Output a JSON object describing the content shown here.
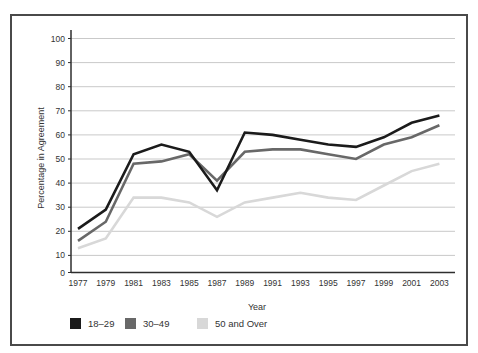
{
  "chart_data": {
    "type": "line",
    "title": "",
    "xlabel": "Year",
    "ylabel": "Percentage in Agreement",
    "categories": [
      "1977",
      "1979",
      "1981",
      "1983",
      "1985",
      "1987",
      "1989",
      "1991",
      "1993",
      "1995",
      "1997",
      "1999",
      "2001",
      "2003"
    ],
    "y_ticks": [
      100,
      90,
      80,
      70,
      60,
      50,
      40,
      30,
      20,
      10,
      0
    ],
    "ylim": [
      0,
      100
    ],
    "grid": true,
    "legend_position": "bottom-left",
    "series": [
      {
        "name": "18–29",
        "color": "#1b1b1b",
        "values": [
          21,
          29,
          52,
          56,
          53,
          37,
          61,
          60,
          58,
          56,
          55,
          59,
          65,
          68
        ]
      },
      {
        "name": "30–49",
        "color": "#686868",
        "values": [
          16,
          24,
          48,
          49,
          52,
          41,
          53,
          54,
          54,
          52,
          50,
          56,
          59,
          64
        ]
      },
      {
        "name": "50 and Over",
        "color": "#d8d8d8",
        "values": [
          13,
          17,
          34,
          34,
          32,
          26,
          32,
          34,
          36,
          34,
          33,
          39,
          45,
          48
        ]
      }
    ]
  },
  "frame": {
    "border_color": "#4a4a4a",
    "grid_color": "#c9c9c9",
    "axis_color": "#2e2e2e"
  }
}
